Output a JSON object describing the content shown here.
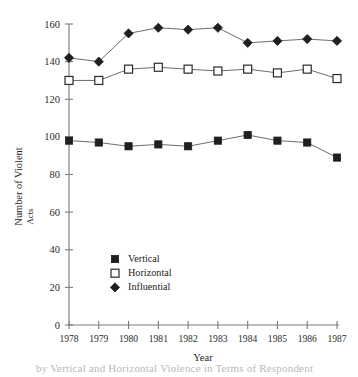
{
  "chart_data": {
    "type": "line",
    "title": "",
    "xlabel": "Year",
    "ylabel": "Number of Violent Acts",
    "ylabel_line1": "Number of Violent",
    "ylabel_line2": "Acts",
    "categories": [
      "1978",
      "1979",
      "1980",
      "1981",
      "1982",
      "1983",
      "1984",
      "1985",
      "1986",
      "1987"
    ],
    "x": [
      1978,
      1979,
      1980,
      1981,
      1982,
      1983,
      1984,
      1985,
      1986,
      1987
    ],
    "xlim": [
      1978,
      1987
    ],
    "ylim": [
      0,
      160
    ],
    "yticks": [
      0,
      20,
      40,
      60,
      80,
      100,
      120,
      140,
      160
    ],
    "ytick_labels": [
      "0",
      "20",
      "40",
      "60",
      "80",
      "100",
      "120",
      "140",
      "160"
    ],
    "grid": false,
    "legend_position": "lower-left-inside",
    "series": [
      {
        "name": "Vertical",
        "marker": "filled-square",
        "color": "#201f1f",
        "values": [
          98,
          97,
          95,
          96,
          95,
          98,
          101,
          98,
          97,
          89
        ]
      },
      {
        "name": "Horizontal",
        "marker": "open-square",
        "color": "#ffffff",
        "values": [
          130,
          130,
          136,
          137,
          136,
          135,
          136,
          134,
          136,
          131
        ]
      },
      {
        "name": "Influential",
        "marker": "filled-diamond",
        "color": "#201f1f",
        "values": [
          142,
          140,
          155,
          158,
          157,
          158,
          150,
          151,
          152,
          151
        ]
      }
    ]
  },
  "legend": {
    "items": [
      {
        "label": "Vertical",
        "marker": "filled-square"
      },
      {
        "label": "Horizontal",
        "marker": "open-square"
      },
      {
        "label": "Influential",
        "marker": "filled-diamond"
      }
    ]
  },
  "caption": {
    "text": "by Vertical and Horizontal Violence in Terms of Respondent"
  },
  "colors": {
    "axis": "#7a7a7a",
    "line": "#6e6e6e",
    "marker_fill": "#201f1f",
    "text": "#242424",
    "background": "#ffffff"
  }
}
